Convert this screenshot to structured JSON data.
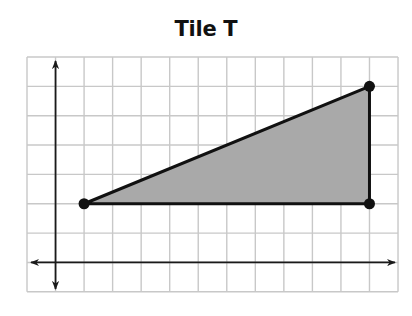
{
  "title": "Tile T",
  "grid": {
    "left": 27,
    "top": 57,
    "cols": 13,
    "rows": 8,
    "cell_w": 28.54,
    "cell_h": 29.35,
    "line_color": "#c8c8c8",
    "border_color": "#c0c0c0"
  },
  "axes": {
    "origin_col": 1,
    "origin_row": 7,
    "color": "#1a1a1a",
    "x_axis": {
      "from_x": 31,
      "to_x": 395,
      "arrows": "both"
    },
    "y_axis": {
      "from_y": 61,
      "to_y": 289,
      "arrows": "both"
    }
  },
  "shape": {
    "name": "Tile T",
    "type": "triangle",
    "fill": "#a9a9a9",
    "stroke": "#111111",
    "vertices": [
      {
        "x": 1,
        "y": 2
      },
      {
        "x": 11,
        "y": 6
      },
      {
        "x": 11,
        "y": 2
      }
    ]
  }
}
